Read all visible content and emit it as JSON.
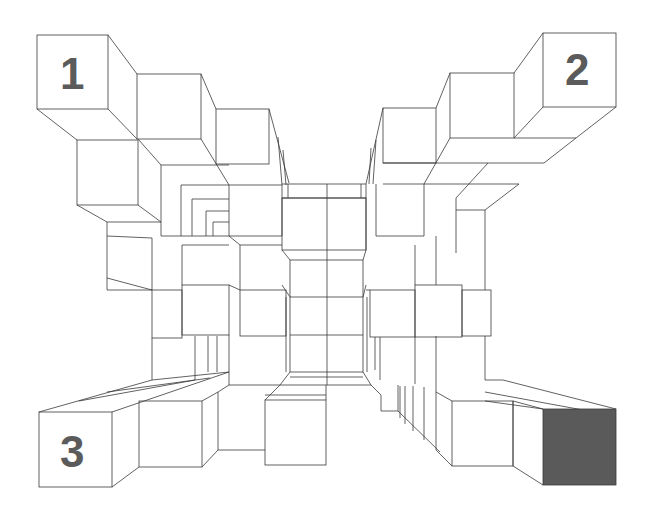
{
  "figure": {
    "type": "isometric cube structure illusion",
    "labels": [
      {
        "id": "1",
        "text": "1",
        "position": "top-left"
      },
      {
        "id": "2",
        "text": "2",
        "position": "top-right"
      },
      {
        "id": "3",
        "text": "3",
        "position": "bottom-left"
      }
    ],
    "highlighted_cube": {
      "position": "bottom-right",
      "fill": "#5a5a5a"
    },
    "line_color": "#3a3a3a",
    "background": "#ffffff"
  }
}
